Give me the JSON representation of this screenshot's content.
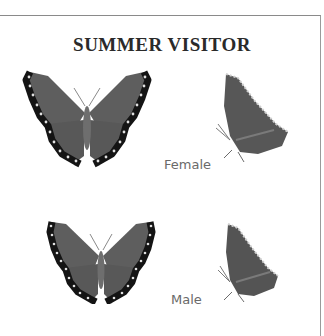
{
  "title": "SUMMER VISITOR",
  "colors": {
    "wing_body": "#5a5a5a",
    "wing_border": "#1a1a1a",
    "wing_spots": "#e8e8e8",
    "frame": "#8a8a8a",
    "label": "#6a6a6a"
  },
  "figures": [
    {
      "name": "female",
      "label": "Female",
      "views": [
        "open-wings",
        "side-view"
      ]
    },
    {
      "name": "male",
      "label": "Male",
      "views": [
        "open-wings",
        "side-view"
      ]
    }
  ]
}
